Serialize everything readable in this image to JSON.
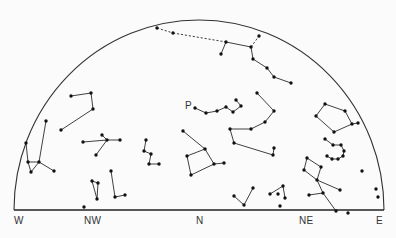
{
  "figure": {
    "type": "star-chart",
    "horizon_labels": [
      {
        "text": "W",
        "x": 14,
        "y": 215
      },
      {
        "text": "NW",
        "x": 84,
        "y": 215
      },
      {
        "text": "N",
        "x": 196,
        "y": 215
      },
      {
        "text": "NE",
        "x": 299,
        "y": 215
      },
      {
        "text": "E",
        "x": 376,
        "y": 215
      }
    ],
    "star_label": {
      "text": "P",
      "x": 185,
      "y": 100
    },
    "colors": {
      "line": "#2a2a2a",
      "star": "#111111",
      "background": "#fbfbfb"
    }
  },
  "chart_data": {
    "type": "scatter",
    "title": "",
    "horizon": {
      "x1": 14,
      "x2": 384,
      "y": 210
    },
    "dome": {
      "cx": 199,
      "cy": 210,
      "rx": 185,
      "ry": 190
    },
    "constellations": [
      {
        "name": "top-chain",
        "stars": [
          [
            157,
            28
          ],
          [
            173,
            33
          ],
          [
            226,
            42
          ],
          [
            251,
            47
          ],
          [
            259,
            36
          ],
          [
            221,
            54
          ],
          [
            253,
            59
          ],
          [
            267,
            68
          ],
          [
            274,
            77
          ],
          [
            291,
            83
          ]
        ],
        "lines": [
          [
            0,
            1,
            "dash"
          ],
          [
            1,
            2,
            "dash"
          ],
          [
            2,
            3
          ],
          [
            2,
            5
          ],
          [
            3,
            4,
            "dash"
          ],
          [
            3,
            6
          ],
          [
            6,
            7
          ],
          [
            7,
            8
          ],
          [
            8,
            9
          ]
        ]
      },
      {
        "name": "P-chain",
        "stars": [
          [
            195,
            108
          ],
          [
            206,
            113
          ],
          [
            217,
            111
          ],
          [
            226,
            107
          ],
          [
            233,
            112
          ],
          [
            241,
            106
          ],
          [
            236,
            100
          ]
        ],
        "lines": [
          [
            0,
            1
          ],
          [
            1,
            2
          ],
          [
            2,
            3
          ],
          [
            3,
            4
          ],
          [
            4,
            5
          ],
          [
            5,
            6
          ]
        ]
      },
      {
        "name": "center-right-hook",
        "stars": [
          [
            257,
            93
          ],
          [
            274,
            111
          ],
          [
            265,
            122
          ],
          [
            251,
            129
          ],
          [
            230,
            129
          ],
          [
            234,
            143
          ],
          [
            273,
            155
          ],
          [
            274,
            148
          ]
        ],
        "lines": [
          [
            0,
            1
          ],
          [
            1,
            2
          ],
          [
            2,
            3
          ],
          [
            3,
            4
          ],
          [
            4,
            5
          ],
          [
            5,
            6
          ],
          [
            6,
            7
          ]
        ]
      },
      {
        "name": "left-upper",
        "stars": [
          [
            71,
            96
          ],
          [
            91,
            93
          ],
          [
            93,
            109
          ],
          [
            61,
            130
          ]
        ],
        "lines": [
          [
            0,
            1
          ],
          [
            1,
            2
          ],
          [
            2,
            3
          ]
        ]
      },
      {
        "name": "square",
        "stars": [
          [
            183,
            131
          ],
          [
            205,
            149
          ],
          [
            187,
            156
          ],
          [
            191,
            175
          ],
          [
            214,
            164
          ],
          [
            224,
            163
          ]
        ],
        "lines": [
          [
            0,
            1
          ],
          [
            1,
            2
          ],
          [
            2,
            3
          ],
          [
            3,
            4
          ],
          [
            4,
            1
          ],
          [
            4,
            5
          ]
        ]
      },
      {
        "name": "pentagon",
        "stars": [
          [
            325,
            104
          ],
          [
            345,
            111
          ],
          [
            352,
            124
          ],
          [
            334,
            132
          ],
          [
            316,
            116
          ],
          [
            358,
            123
          ]
        ],
        "lines": [
          [
            0,
            1
          ],
          [
            1,
            2
          ],
          [
            2,
            3
          ],
          [
            3,
            4
          ],
          [
            4,
            0
          ],
          [
            2,
            5
          ]
        ]
      },
      {
        "name": "hook",
        "stars": [
          [
            325,
            139
          ],
          [
            333,
            145
          ],
          [
            341,
            145
          ],
          [
            344,
            151
          ],
          [
            343,
            156
          ],
          [
            338,
            159
          ],
          [
            332,
            159
          ],
          [
            327,
            156
          ]
        ],
        "lines": [
          [
            0,
            1
          ],
          [
            1,
            2
          ],
          [
            2,
            3
          ],
          [
            3,
            4
          ],
          [
            4,
            5
          ],
          [
            5,
            6
          ],
          [
            6,
            7
          ]
        ]
      },
      {
        "name": "NE-kite",
        "stars": [
          [
            307,
            158
          ],
          [
            321,
            167
          ],
          [
            317,
            180
          ],
          [
            304,
            170
          ],
          [
            340,
            190
          ],
          [
            323,
            193
          ],
          [
            309,
            195
          ],
          [
            336,
            211
          ],
          [
            348,
            213
          ]
        ],
        "lines": [
          [
            0,
            1
          ],
          [
            1,
            2
          ],
          [
            2,
            3
          ],
          [
            3,
            0
          ],
          [
            2,
            4
          ],
          [
            2,
            5
          ],
          [
            5,
            6
          ],
          [
            5,
            7
          ]
        ]
      },
      {
        "name": "E-singles",
        "stars": [
          [
            362,
            171
          ],
          [
            376,
            189
          ],
          [
            378,
            197
          ]
        ],
        "lines": []
      },
      {
        "name": "N-vee",
        "stars": [
          [
            234,
            196
          ],
          [
            244,
            205
          ],
          [
            253,
            188
          ]
        ],
        "lines": [
          [
            0,
            1
          ],
          [
            1,
            2
          ]
        ]
      },
      {
        "name": "N-small",
        "stars": [
          [
            270,
            194
          ],
          [
            283,
            186
          ],
          [
            285,
            198
          ],
          [
            278,
            194
          ],
          [
            280,
            206
          ]
        ],
        "lines": [
          [
            0,
            1
          ],
          [
            1,
            2
          ]
        ]
      },
      {
        "name": "W-group",
        "stars": [
          [
            46,
            121
          ],
          [
            39,
            162
          ],
          [
            28,
            162
          ],
          [
            31,
            172
          ],
          [
            54,
            171
          ],
          [
            26,
            143
          ]
        ],
        "lines": [
          [
            0,
            1
          ],
          [
            2,
            1
          ],
          [
            1,
            4
          ],
          [
            2,
            3
          ],
          [
            3,
            1
          ],
          [
            5,
            2
          ]
        ]
      },
      {
        "name": "cross",
        "stars": [
          [
            83,
            142
          ],
          [
            107,
            140
          ],
          [
            120,
            140
          ],
          [
            102,
            135
          ],
          [
            96,
            155
          ]
        ],
        "lines": [
          [
            0,
            1
          ],
          [
            1,
            2
          ],
          [
            3,
            1
          ],
          [
            1,
            4
          ]
        ]
      },
      {
        "name": "zigzag",
        "stars": [
          [
            146,
            140
          ],
          [
            144,
            151
          ],
          [
            151,
            154
          ],
          [
            149,
            164
          ],
          [
            159,
            164
          ]
        ],
        "lines": [
          [
            0,
            1
          ],
          [
            1,
            2
          ],
          [
            2,
            3
          ],
          [
            3,
            4
          ]
        ]
      },
      {
        "name": "triangle",
        "stars": [
          [
            92,
            181
          ],
          [
            98,
            183
          ],
          [
            97,
            199
          ]
        ],
        "lines": [
          [
            0,
            1
          ],
          [
            1,
            2
          ],
          [
            2,
            0
          ]
        ]
      },
      {
        "name": "ell",
        "stars": [
          [
            111,
            171
          ],
          [
            115,
            197
          ],
          [
            125,
            195
          ]
        ],
        "lines": [
          [
            0,
            1
          ],
          [
            1,
            2
          ]
        ]
      },
      {
        "name": "NW-single",
        "stars": [
          [
            84,
            207
          ]
        ],
        "lines": []
      }
    ],
    "xlabel": "",
    "ylabel": "",
    "legend": "none",
    "grid": false
  }
}
